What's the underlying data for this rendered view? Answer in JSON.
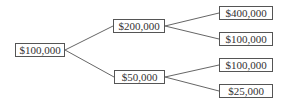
{
  "diagram": {
    "type": "binomial-tree",
    "root": {
      "label": "$100,000"
    },
    "level1": [
      {
        "label": "$200,000"
      },
      {
        "label": "$50,000"
      }
    ],
    "level2": [
      {
        "label": "$400,000",
        "parent": "$200,000"
      },
      {
        "label": "$100,000",
        "parent": "$200,000"
      },
      {
        "label": "$100,000",
        "parent": "$50,000"
      },
      {
        "label": "$25,000",
        "parent": "$50,000"
      }
    ]
  }
}
